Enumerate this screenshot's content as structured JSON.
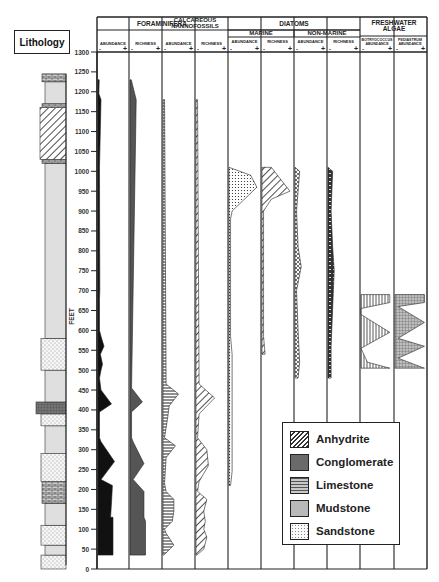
{
  "chart_data": {
    "type": "area",
    "title": "",
    "ylabel": "FEET",
    "ylim": [
      0,
      1300
    ],
    "y_ticks": [
      0,
      50,
      100,
      150,
      200,
      250,
      300,
      350,
      400,
      450,
      500,
      550,
      600,
      650,
      700,
      750,
      800,
      850,
      900,
      950,
      1000,
      1050,
      1100,
      1150,
      1200,
      1250,
      1300
    ],
    "lithology_label": "Lithology",
    "groups": [
      {
        "name": "FORAMINIFERA",
        "columns": [
          "ABUNDANCE",
          "RICHNESS"
        ]
      },
      {
        "name": "CALCAREOUS NANNOFOSSILS",
        "columns": [
          "ABUNDANCE",
          "RICHNESS"
        ]
      },
      {
        "name": "DIATOMS",
        "subgroups": [
          {
            "name": "MARINE",
            "columns": [
              "ABUNDANCE",
              "RICHNESS"
            ]
          },
          {
            "name": "NON-MARINE",
            "columns": [
              "ABUNDANCE",
              "RICHNESS"
            ]
          }
        ]
      },
      {
        "name": "FRESHWATER ALGAE",
        "columns": [
          "BOTRYOCOCCUS ABUNDANCE",
          "PEDIASTRUM ABUNDANCE"
        ]
      }
    ],
    "scale_markers": {
      "low": "-",
      "high": "+"
    },
    "series": [
      {
        "name": "Foraminifera Abundance",
        "fill": "#111111",
        "points": [
          [
            35,
            0.5
          ],
          [
            130,
            0.5
          ],
          [
            130,
            0.42
          ],
          [
            180,
            0.46
          ],
          [
            210,
            0.48
          ],
          [
            225,
            0.1
          ],
          [
            270,
            0.55
          ],
          [
            320,
            0.1
          ],
          [
            330,
            0.05
          ],
          [
            395,
            0.05
          ],
          [
            415,
            0.45
          ],
          [
            450,
            0.1
          ],
          [
            480,
            0.05
          ],
          [
            500,
            0.1
          ],
          [
            515,
            0.15
          ],
          [
            540,
            0.08
          ],
          [
            560,
            0.2
          ],
          [
            585,
            0.1
          ],
          [
            600,
            0.05
          ],
          [
            680,
            0.05
          ],
          [
            700,
            0.06
          ],
          [
            1010,
            0.05
          ],
          [
            1180,
            0.1
          ],
          [
            1195,
            0.03
          ],
          [
            1230,
            0.04
          ]
        ]
      },
      {
        "name": "Foraminifera Richness",
        "fill": "#555555",
        "points": [
          [
            35,
            0.5
          ],
          [
            120,
            0.5
          ],
          [
            130,
            0.45
          ],
          [
            165,
            0.45
          ],
          [
            195,
            0.45
          ],
          [
            225,
            0.1
          ],
          [
            265,
            0.45
          ],
          [
            320,
            0.1
          ],
          [
            330,
            0.05
          ],
          [
            395,
            0.05
          ],
          [
            420,
            0.4
          ],
          [
            455,
            0.05
          ],
          [
            1180,
            0.2
          ],
          [
            1230,
            0.04
          ]
        ]
      },
      {
        "name": "Calcareous Nannofossils Abundance",
        "fill": "horizontal-lines",
        "points": [
          [
            35,
            0.03
          ],
          [
            60,
            0.35
          ],
          [
            90,
            0.1
          ],
          [
            100,
            0.05
          ],
          [
            120,
            0.3
          ],
          [
            145,
            0.35
          ],
          [
            175,
            0.35
          ],
          [
            195,
            0.1
          ],
          [
            215,
            0.05
          ],
          [
            280,
            0.1
          ],
          [
            310,
            0.4
          ],
          [
            330,
            0.05
          ],
          [
            380,
            0.15
          ],
          [
            410,
            0.2
          ],
          [
            440,
            0.5
          ],
          [
            465,
            0.1
          ],
          [
            1180,
            0.05
          ]
        ]
      },
      {
        "name": "Calcareous Nannofossils Richness",
        "fill": "diagonal-hatch",
        "points": [
          [
            35,
            0.03
          ],
          [
            50,
            0.25
          ],
          [
            80,
            0.35
          ],
          [
            100,
            0.25
          ],
          [
            120,
            0.3
          ],
          [
            145,
            0.25
          ],
          [
            175,
            0.35
          ],
          [
            195,
            0.05
          ],
          [
            220,
            0.1
          ],
          [
            260,
            0.4
          ],
          [
            300,
            0.35
          ],
          [
            330,
            0.05
          ],
          [
            390,
            0.1
          ],
          [
            430,
            0.6
          ],
          [
            465,
            0.1
          ],
          [
            1180,
            0.05
          ]
        ]
      },
      {
        "name": "Marine Diatom Abundance",
        "fill": "dots",
        "points": [
          [
            210,
            0.05
          ],
          [
            245,
            0.1
          ],
          [
            540,
            0.1
          ],
          [
            585,
            0.05
          ],
          [
            740,
            0.05
          ],
          [
            880,
            0.05
          ],
          [
            900,
            0.1
          ],
          [
            960,
            0.9
          ],
          [
            990,
            0.7
          ],
          [
            1010,
            0.0
          ]
        ]
      },
      {
        "name": "Marine Diatom Richness",
        "fill": "diagonal-hatch",
        "points": [
          [
            540,
            0.1
          ],
          [
            585,
            0.05
          ],
          [
            740,
            0.05
          ],
          [
            900,
            0.05
          ],
          [
            930,
            0.3
          ],
          [
            950,
            0.9
          ],
          [
            1010,
            0.3
          ]
        ]
      },
      {
        "name": "Non-Marine Diatom Abundance",
        "fill": "crosshatch",
        "points": [
          [
            480,
            0.1
          ],
          [
            520,
            0.15
          ],
          [
            600,
            0.1
          ],
          [
            700,
            0.05
          ],
          [
            760,
            0.2
          ],
          [
            810,
            0.1
          ],
          [
            900,
            0.05
          ],
          [
            1000,
            0.15
          ],
          [
            1010,
            0.0
          ]
        ]
      },
      {
        "name": "Non-Marine Diatom Richness",
        "fill": "dashed-dark",
        "points": [
          [
            480,
            0.1
          ],
          [
            560,
            0.1
          ],
          [
            750,
            0.2
          ],
          [
            810,
            0.15
          ],
          [
            900,
            0.1
          ],
          [
            1000,
            0.15
          ],
          [
            1010,
            0.0
          ]
        ]
      },
      {
        "name": "Botryococcus Abundance",
        "fill": "vertical-lines",
        "points": [
          [
            505,
            0.0
          ],
          [
            505,
            0.9
          ],
          [
            520,
            0.2
          ],
          [
            555,
            0.0
          ],
          [
            595,
            0.9
          ],
          [
            640,
            0.0
          ],
          [
            655,
            0.0
          ],
          [
            670,
            0.9
          ],
          [
            690,
            0.9
          ]
        ]
      },
      {
        "name": "Pediastrum Abundance",
        "fill": "grid-dark",
        "points": [
          [
            505,
            0.0
          ],
          [
            505,
            0.95
          ],
          [
            530,
            0.1
          ],
          [
            560,
            0.95
          ],
          [
            580,
            0.1
          ],
          [
            620,
            0.95
          ],
          [
            660,
            0.1
          ],
          [
            670,
            0.95
          ],
          [
            690,
            0.95
          ]
        ]
      }
    ],
    "legend": [
      {
        "label": "Anhydrite",
        "pattern": "diagonal-hatch"
      },
      {
        "label": "Conglomerate",
        "pattern": "dark-stipple"
      },
      {
        "label": "Limestone",
        "pattern": "brick"
      },
      {
        "label": "Mudstone",
        "pattern": "fine-dots"
      },
      {
        "label": "Sandstone",
        "pattern": "coarse-dots"
      }
    ],
    "lithology_intervals": [
      {
        "from": 0,
        "to": 35,
        "type": "Sandstone"
      },
      {
        "from": 35,
        "to": 60,
        "type": "Mudstone"
      },
      {
        "from": 60,
        "to": 110,
        "type": "Sandstone"
      },
      {
        "from": 110,
        "to": 165,
        "type": "Mudstone"
      },
      {
        "from": 165,
        "to": 220,
        "type": "Limestone"
      },
      {
        "from": 220,
        "to": 290,
        "type": "Sandstone"
      },
      {
        "from": 290,
        "to": 360,
        "type": "Mudstone"
      },
      {
        "from": 360,
        "to": 390,
        "type": "Sandstone"
      },
      {
        "from": 390,
        "to": 420,
        "type": "Conglomerate"
      },
      {
        "from": 420,
        "to": 500,
        "type": "Mudstone"
      },
      {
        "from": 500,
        "to": 580,
        "type": "Sandstone"
      },
      {
        "from": 580,
        "to": 1020,
        "type": "Mudstone"
      },
      {
        "from": 1020,
        "to": 1030,
        "type": "Limestone"
      },
      {
        "from": 1030,
        "to": 1160,
        "type": "Anhydrite"
      },
      {
        "from": 1160,
        "to": 1170,
        "type": "Limestone"
      },
      {
        "from": 1170,
        "to": 1225,
        "type": "Mudstone"
      },
      {
        "from": 1225,
        "to": 1245,
        "type": "Limestone"
      }
    ],
    "grid": false,
    "legend_position": "lower-right"
  },
  "header": {
    "lithology": "Lithology",
    "feet": "FEET"
  }
}
